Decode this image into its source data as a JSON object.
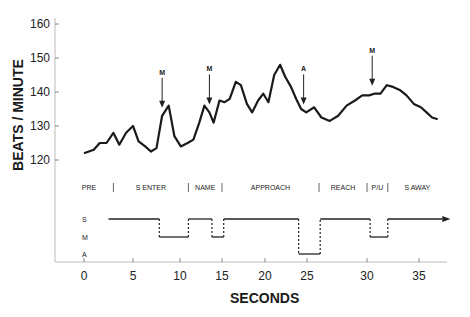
{
  "chart_data": {
    "type": "line",
    "title": "",
    "xlabel": "SECONDS",
    "ylabel": "BEATS / MINUTE",
    "xlim": [
      -3,
      38
    ],
    "ylim": [
      110,
      162
    ],
    "grid": false,
    "x_ticks": [
      0,
      5,
      10,
      15,
      20,
      25,
      30,
      35
    ],
    "y_ticks": [
      120,
      130,
      140,
      150,
      160
    ],
    "series": [
      {
        "name": "heart rate",
        "x": [
          0,
          1,
          1.6,
          2.3,
          3.0,
          3.6,
          4.3,
          5.0,
          5.6,
          6.3,
          6.9,
          7.5,
          8.1,
          8.8,
          9.4,
          10.1,
          10.9,
          11.6,
          12.3,
          12.9,
          13.5,
          14.0,
          14.7,
          15.3,
          15.9,
          16.6,
          17.2,
          17.9,
          18.5,
          19.2,
          19.8,
          20.4,
          21.1,
          21.8,
          22.4,
          23.1,
          23.7,
          24.3,
          24.9,
          25.6,
          26.2,
          26.9,
          27.6,
          28.3,
          29.0,
          29.6,
          30.2,
          30.7,
          31.3,
          31.9,
          32.5,
          33.2,
          33.8,
          34.5,
          35.2,
          35.8,
          36.4,
          37.0
        ],
        "values": [
          122,
          123,
          125,
          125,
          128,
          124.5,
          128,
          130,
          125.5,
          124,
          122.5,
          123.5,
          133,
          136,
          127,
          124,
          125,
          126,
          131,
          136,
          134,
          131,
          137.5,
          137,
          138,
          143,
          142,
          136.5,
          134,
          137.5,
          139.5,
          137,
          145,
          148,
          144.5,
          141.5,
          138,
          135,
          134,
          135.5,
          132.5,
          131.5,
          133,
          136,
          137.5,
          139,
          139,
          139.5,
          139.5,
          142,
          141.5,
          140.5,
          139,
          136.5,
          135.5,
          134,
          132.5,
          132
        ]
      }
    ],
    "annotations": [
      {
        "label": "M",
        "x": 8.1,
        "type": "arrow-down"
      },
      {
        "label": "M",
        "x": 13.5,
        "type": "arrow-down"
      },
      {
        "label": "A",
        "x": 24.6,
        "type": "arrow-down"
      },
      {
        "label": "M",
        "x": 30.5,
        "type": "arrow-down"
      }
    ],
    "phases": [
      {
        "label": "PRE",
        "start": -2,
        "end": 3
      },
      {
        "label": "S ENTER",
        "start": 3,
        "end": 11
      },
      {
        "label": "NAME",
        "start": 11,
        "end": 15
      },
      {
        "label": "APPROACH",
        "start": 15,
        "end": 26
      },
      {
        "label": "REACH",
        "start": 26,
        "end": 30
      },
      {
        "label": "P/U",
        "start": 30,
        "end": 32
      },
      {
        "label": "S AWAY",
        "start": 32,
        "end": 38
      }
    ],
    "state_trace": {
      "levels": [
        "S",
        "M",
        "A"
      ],
      "segments": [
        {
          "level": "S",
          "start": 2.5,
          "end": 7.8
        },
        {
          "level": "M",
          "start": 7.8,
          "end": 11.0
        },
        {
          "level": "S",
          "start": 11.0,
          "end": 13.8
        },
        {
          "level": "M",
          "start": 13.8,
          "end": 15.2
        },
        {
          "level": "S",
          "start": 15.2,
          "end": 24.0
        },
        {
          "level": "A",
          "start": 24.0,
          "end": 26.1
        },
        {
          "level": "S",
          "start": 26.1,
          "end": 30.3
        },
        {
          "level": "M",
          "start": 30.3,
          "end": 32.0
        },
        {
          "level": "S",
          "start": 32.0,
          "end": 37.5
        }
      ]
    }
  },
  "labels": {
    "ylabel": "BEATS / MINUTE",
    "xlabel": "SECONDS"
  }
}
